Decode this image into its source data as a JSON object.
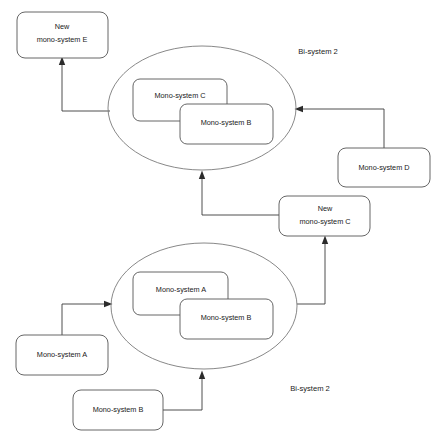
{
  "diagram": {
    "stroke_color": "#555555",
    "ellipse_color": "#7a7a7a",
    "arrow_color": "#2b2b2b",
    "background": "#ffffff",
    "nodes": {
      "new_mono_e": {
        "line1": "New",
        "line2": "mono-system E"
      },
      "mono_d": {
        "label": "Mono-system D"
      },
      "new_mono_c": {
        "line1": "New",
        "line2": "mono-system C"
      },
      "mono_a_external": {
        "label": "Mono-system A"
      },
      "mono_b_external": {
        "label": "Mono-system B"
      },
      "top_inner_back": {
        "label": "Mono-system C"
      },
      "top_inner_front": {
        "label": "Mono-system B"
      },
      "bottom_inner_back": {
        "label": "Mono-system A"
      },
      "bottom_inner_front": {
        "label": "Mono-system B"
      }
    },
    "groups": {
      "top_bisystem": {
        "label": "Bi-system 2"
      },
      "bottom_bisystem": {
        "label": "Bi-system 2"
      }
    }
  }
}
